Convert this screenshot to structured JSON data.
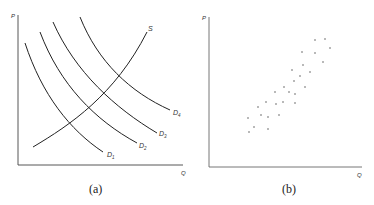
{
  "chart_data": [
    {
      "panel": "(a)",
      "type": "line",
      "title": "",
      "xlabel": "Q",
      "ylabel": "P",
      "grid": false,
      "legend": "inline curve labels",
      "series": [
        {
          "name": "S",
          "label": "S",
          "points": [
            [
              33,
              147
            ],
            [
              70,
              120
            ],
            [
              105,
              90
            ],
            [
              130,
              60
            ],
            [
              147,
              32
            ]
          ]
        },
        {
          "name": "D1",
          "label": "D",
          "sub": "1",
          "points": [
            [
              25,
              43
            ],
            [
              45,
              90
            ],
            [
              70,
              125
            ],
            [
              103,
              152
            ]
          ]
        },
        {
          "name": "D2",
          "label": "D",
          "sub": "2",
          "points": [
            [
              40,
              32
            ],
            [
              65,
              80
            ],
            [
              95,
              115
            ],
            [
              137,
              143
            ]
          ]
        },
        {
          "name": "D3",
          "label": "D",
          "sub": "3",
          "points": [
            [
              53,
              22
            ],
            [
              80,
              65
            ],
            [
              115,
              102
            ],
            [
              157,
              133
            ]
          ]
        },
        {
          "name": "D4",
          "label": "D",
          "sub": "4",
          "points": [
            [
              80,
              17
            ],
            [
              100,
              55
            ],
            [
              130,
              85
            ],
            [
              170,
              110
            ]
          ]
        }
      ],
      "caption": "(a)"
    },
    {
      "panel": "(b)",
      "type": "scatter",
      "title": "",
      "xlabel": "Q",
      "ylabel": "P",
      "grid": false,
      "points": [
        [
          315,
          40
        ],
        [
          325,
          39
        ],
        [
          302,
          52
        ],
        [
          315,
          53
        ],
        [
          330,
          48
        ],
        [
          323,
          62
        ],
        [
          303,
          65
        ],
        [
          292,
          70
        ],
        [
          310,
          72
        ],
        [
          300,
          76
        ],
        [
          294,
          81
        ],
        [
          305,
          87
        ],
        [
          284,
          87
        ],
        [
          275,
          92
        ],
        [
          289,
          92
        ],
        [
          295,
          94
        ],
        [
          266,
          102
        ],
        [
          283,
          102
        ],
        [
          276,
          104
        ],
        [
          295,
          103
        ],
        [
          258,
          107
        ],
        [
          261,
          115
        ],
        [
          268,
          117
        ],
        [
          279,
          115
        ],
        [
          248,
          118
        ],
        [
          254,
          127
        ],
        [
          268,
          129
        ],
        [
          249,
          132
        ]
      ],
      "caption": "(b)"
    }
  ],
  "panels": {
    "a": {
      "ylabel": "P",
      "xlabel": "Q",
      "caption": "(a)",
      "labels": {
        "s": "S",
        "d": "D",
        "d1": "1",
        "d2": "2",
        "d3": "3",
        "d4": "4"
      }
    },
    "b": {
      "ylabel": "P",
      "xlabel": "Q",
      "caption": "(b)"
    }
  }
}
